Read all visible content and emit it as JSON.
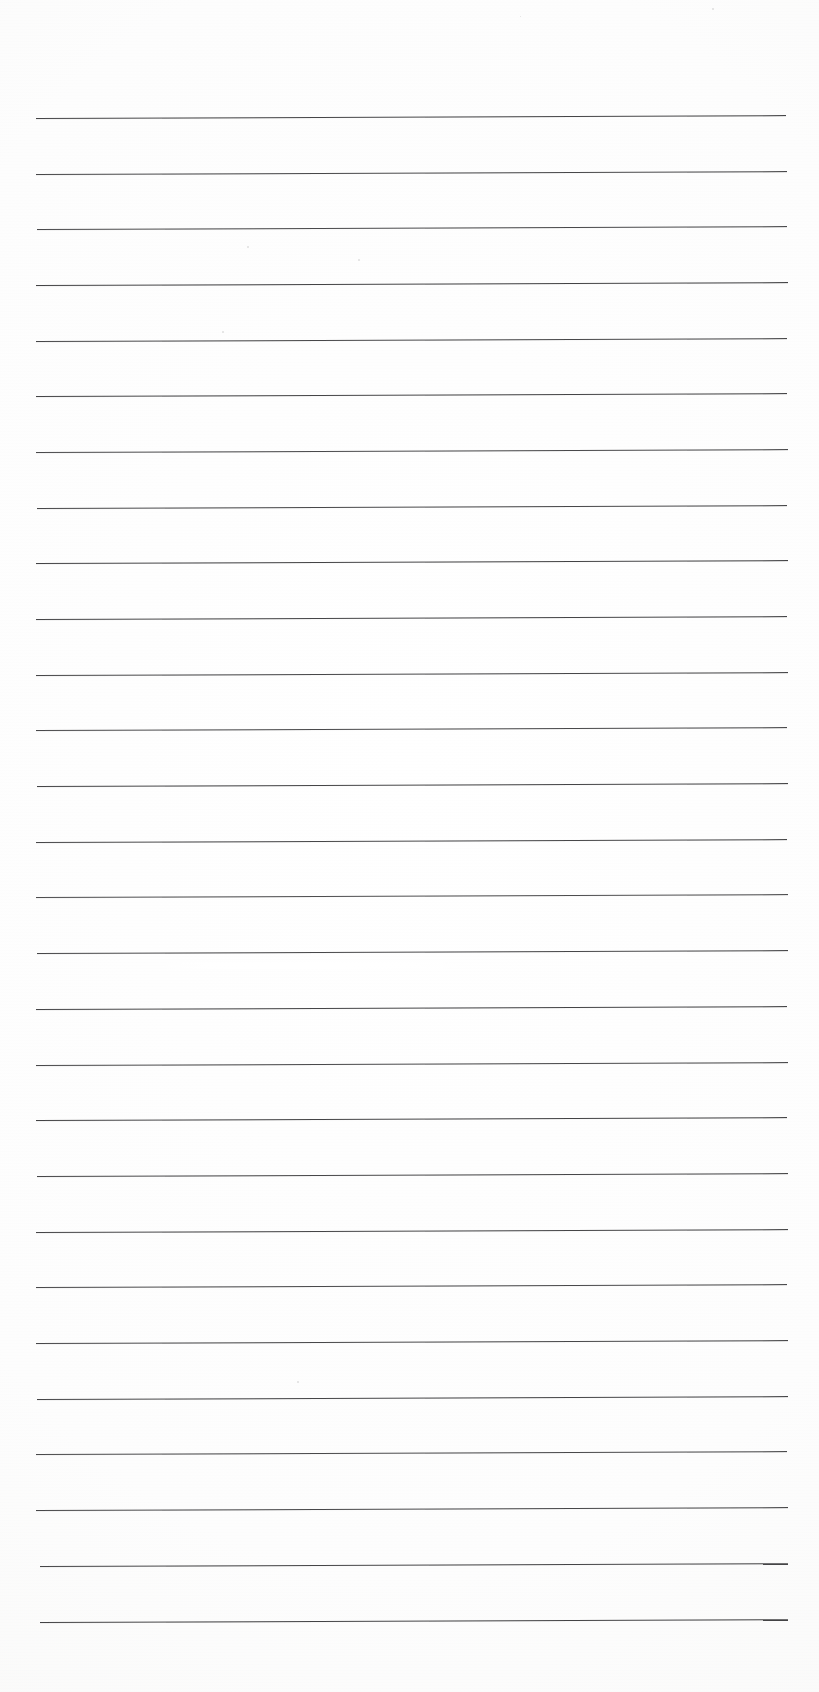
{
  "document": {
    "kind": "scanned-lined-notebook-page",
    "title": "Blank Ruled Paper Scan",
    "visible_text": "",
    "page_width": 819,
    "page_height": 1692,
    "background_color": "#fefefe",
    "paper_tint": "#f8f8f7"
  },
  "ruling": {
    "line_color": "#3a3a3c",
    "line_thickness_px": 1.2,
    "line_count": 28,
    "first_line_y": 118,
    "line_spacing_px": 55.7,
    "left_margin_x": 36,
    "right_margin_x": 788,
    "tilt_degrees": -0.22,
    "left_edge_x_values": [
      36,
      36,
      37,
      36,
      36,
      36,
      36,
      37,
      36,
      36,
      36,
      36,
      37,
      36,
      36,
      37,
      36,
      36,
      36,
      37,
      36,
      36,
      36,
      37,
      36,
      36,
      40,
      40
    ],
    "right_edge_x_values": [
      786,
      787,
      787,
      788,
      787,
      787,
      788,
      787,
      788,
      787,
      788,
      787,
      788,
      787,
      788,
      788,
      787,
      788,
      787,
      788,
      788,
      787,
      788,
      788,
      787,
      788,
      788,
      788
    ],
    "line_y_values": [
      118,
      174,
      229,
      285,
      341,
      396,
      452,
      508,
      563,
      619,
      675,
      730,
      786,
      842,
      897,
      953,
      1009,
      1065,
      1120,
      1176,
      1232,
      1287,
      1343,
      1399,
      1454,
      1510,
      1566,
      1622
    ],
    "line_opacity_values": [
      0.94,
      0.93,
      0.92,
      0.95,
      0.93,
      0.94,
      0.92,
      0.93,
      0.95,
      0.94,
      0.93,
      0.92,
      0.94,
      0.93,
      0.9,
      0.93,
      0.94,
      0.92,
      0.95,
      0.93,
      0.94,
      0.92,
      0.93,
      0.94,
      0.92,
      0.93,
      0.94,
      0.95
    ]
  },
  "artifacts": {
    "scan_streak": {
      "name": "scanner-light-streak",
      "x": 150,
      "y": 962,
      "width": 330,
      "height": 7
    },
    "specks": [
      {
        "name": "dust-speck",
        "x": 247,
        "y": 246,
        "size": 2
      },
      {
        "name": "dust-speck",
        "x": 222,
        "y": 331,
        "size": 2
      },
      {
        "name": "dust-speck",
        "x": 358,
        "y": 259,
        "size": 2
      },
      {
        "name": "dust-speck",
        "x": 712,
        "y": 8,
        "size": 2
      },
      {
        "name": "dust-speck",
        "x": 297,
        "y": 1381,
        "size": 2
      },
      {
        "name": "dust-speck",
        "x": 520,
        "y": 16,
        "size": 1
      }
    ]
  },
  "margins": {
    "top_margin_px": 118,
    "bottom_margin_px": 70,
    "left_margin_px": 36,
    "right_margin_px": 31
  }
}
